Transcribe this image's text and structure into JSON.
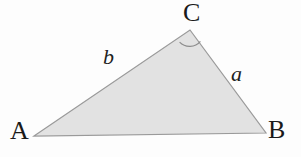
{
  "figure": {
    "name": "labeled-triangle-diagram",
    "background_color": "#fdfdfd"
  },
  "triangle": {
    "fill_color": "#e2e2e2",
    "stroke_color": "#9a9a9a",
    "stroke_width": 1.2,
    "vertices": [
      {
        "name": "A",
        "label": "A",
        "x": 34,
        "y": 136
      },
      {
        "name": "B",
        "label": "B",
        "x": 266,
        "y": 133
      },
      {
        "name": "C",
        "label": "C",
        "x": 190,
        "y": 30
      }
    ],
    "points_path": "34,136 190,30 266,133"
  },
  "vertex_labels": {
    "A": "A",
    "B": "B",
    "C": "C"
  },
  "side_labels": {
    "a": "a",
    "b": "b"
  },
  "angle_marker": {
    "at_vertex": "C",
    "radius": 14,
    "stroke_color": "#8d8d8d",
    "stroke_width": 1.2,
    "arc_path": "M 179.6 42.2 A 14 14 0 0 0 200.4 41.4"
  }
}
